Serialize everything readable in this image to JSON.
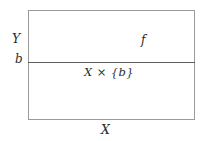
{
  "figure": {
    "type": "math-diagram",
    "background_color": "#ffffff",
    "rect_border_color": "#9a9a9a",
    "slice_line_color": "#5d5d5d",
    "text_color": "#2b2b2b"
  },
  "labels": {
    "vertical_axis": "Y",
    "slice_height": "b",
    "map": "f",
    "slice": "X × {b}",
    "horizontal_axis": "X"
  }
}
